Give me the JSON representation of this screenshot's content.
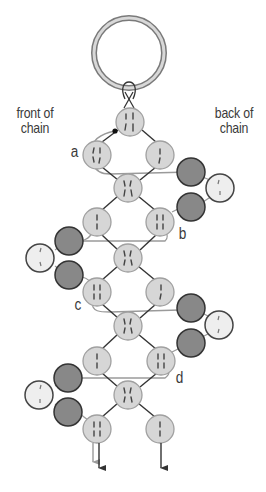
{
  "labels": {
    "front": {
      "line1": "front of",
      "line2": "chain"
    },
    "back": {
      "line1": "back of",
      "line2": "chain"
    },
    "letters": {
      "a": "a",
      "b": "b",
      "c": "c",
      "d": "d"
    }
  },
  "colors": {
    "ring_stroke": "#7a7a7a",
    "ring_fill": "#d8d8d8",
    "bead_light_fill": "#d6d6d6",
    "bead_light_stroke": "#a0a0a0",
    "bead_dark_fill": "#888888",
    "bead_dark_stroke": "#333333",
    "bead_white_fill": "#eeeeee",
    "bead_white_stroke": "#444444",
    "thread_dark": "#333333",
    "thread_gray": "#9a9a9a"
  },
  "diagram": {
    "ring": {
      "cx": 129,
      "cy": 53,
      "r": 35
    },
    "column_beads": [
      {
        "id": "top",
        "cx": 130,
        "cy": 122
      },
      {
        "id": "a-left",
        "cx": 97,
        "cy": 155,
        "label": "a"
      },
      {
        "id": "a-right",
        "cx": 160,
        "cy": 155
      },
      {
        "id": "center-1",
        "cx": 128,
        "cy": 188
      },
      {
        "id": "b-left",
        "cx": 97,
        "cy": 222
      },
      {
        "id": "b-right",
        "cx": 160,
        "cy": 222,
        "label": "b"
      },
      {
        "id": "center-2",
        "cx": 128,
        "cy": 258
      },
      {
        "id": "c-left",
        "cx": 97,
        "cy": 292,
        "label": "c"
      },
      {
        "id": "c-right",
        "cx": 160,
        "cy": 292
      },
      {
        "id": "center-3",
        "cx": 128,
        "cy": 326
      },
      {
        "id": "d-left",
        "cx": 97,
        "cy": 361
      },
      {
        "id": "d-right",
        "cx": 161,
        "cy": 361,
        "label": "d"
      },
      {
        "id": "center-4",
        "cx": 128,
        "cy": 395
      },
      {
        "id": "bottom-left",
        "cx": 97,
        "cy": 429
      },
      {
        "id": "bottom-right",
        "cx": 160,
        "cy": 429
      }
    ],
    "side_clusters": [
      {
        "side": "back",
        "dark": [
          {
            "cx": 191,
            "cy": 172
          },
          {
            "cx": 191,
            "cy": 207
          }
        ],
        "white": {
          "cx": 220,
          "cy": 188
        }
      },
      {
        "side": "front",
        "dark": [
          {
            "cx": 69,
            "cy": 241
          },
          {
            "cx": 69,
            "cy": 275
          }
        ],
        "white": {
          "cx": 40,
          "cy": 258
        }
      },
      {
        "side": "back",
        "dark": [
          {
            "cx": 191,
            "cy": 308
          },
          {
            "cx": 191,
            "cy": 343
          }
        ],
        "white": {
          "cx": 219,
          "cy": 325
        }
      },
      {
        "side": "front",
        "dark": [
          {
            "cx": 68,
            "cy": 378
          },
          {
            "cx": 68,
            "cy": 412
          }
        ],
        "white": {
          "cx": 39,
          "cy": 395
        }
      }
    ],
    "arrows": [
      {
        "id": "arrow-gray-left",
        "x": 93,
        "y1": 443,
        "y2": 470,
        "color": "gray"
      },
      {
        "id": "arrow-dark-left",
        "x": 99,
        "y1": 443,
        "y2": 476,
        "color": "dark"
      },
      {
        "id": "arrow-dark-right",
        "x": 161,
        "y1": 443,
        "y2": 476,
        "color": "dark"
      }
    ]
  }
}
